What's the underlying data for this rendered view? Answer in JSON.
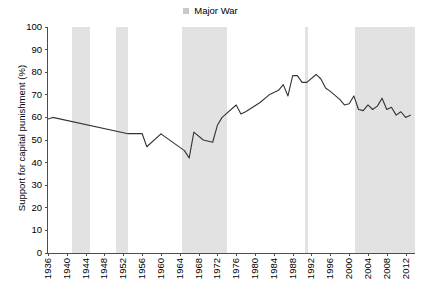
{
  "legend": {
    "position": "top-center",
    "entries": [
      {
        "label": "Major War",
        "swatch_color": "#c9c9c9",
        "icon": "square-swatch-icon"
      }
    ]
  },
  "chart_data": {
    "type": "line",
    "title": "",
    "subtitle": "",
    "xlabel": "",
    "ylabel": "Support for capital punishment (%)",
    "xlim": [
      1936,
      2014
    ],
    "ylim": [
      0,
      100
    ],
    "grid": false,
    "line_color": "#333333",
    "band_color": "#e2e2e2",
    "y_ticks": [
      0,
      10,
      20,
      30,
      40,
      50,
      60,
      70,
      80,
      90,
      100
    ],
    "x_ticks": [
      1936,
      1940,
      1944,
      1948,
      1952,
      1956,
      1960,
      1964,
      1968,
      1972,
      1976,
      1980,
      1984,
      1988,
      1992,
      1996,
      2000,
      2004,
      2008,
      2012
    ],
    "series": [
      {
        "name": "Support for capital punishment (%)",
        "x": [
          1936,
          1937,
          1953,
          1956,
          1957,
          1960,
          1965,
          1966,
          1967,
          1969,
          1971,
          1972,
          1973,
          1976,
          1977,
          1978,
          1981,
          1983,
          1985,
          1986,
          1987,
          1988,
          1989,
          1990,
          1991,
          1993,
          1994,
          1995,
          1996,
          1998,
          1999,
          2000,
          2001,
          2002,
          2003,
          2004,
          2005,
          2006,
          2007,
          2008,
          2009,
          2010,
          2011,
          2012,
          2013
        ],
        "values": [
          59.3,
          60.0,
          52.8,
          52.9,
          47.0,
          52.7,
          45.3,
          42.0,
          53.5,
          50.0,
          49.0,
          56.5,
          60.0,
          65.5,
          61.5,
          62.5,
          66.5,
          70.0,
          72.0,
          74.5,
          69.5,
          78.5,
          78.5,
          75.5,
          75.5,
          79.0,
          77.0,
          73.0,
          71.5,
          68.0,
          65.5,
          66.0,
          69.5,
          63.5,
          63.0,
          65.5,
          63.5,
          65.0,
          68.5,
          63.5,
          64.5,
          61.0,
          62.5,
          60.0,
          61.0
        ]
      }
    ],
    "war_bands": [
      {
        "name": "World War II",
        "start": 1941,
        "end": 1945
      },
      {
        "name": "Korean War",
        "start": 1950.5,
        "end": 1953
      },
      {
        "name": "Vietnam War",
        "start": 1964.5,
        "end": 1974
      },
      {
        "name": "Gulf War",
        "start": 1990.6,
        "end": 1991.3
      },
      {
        "name": "Afghanistan and Iraq Wars",
        "start": 2001.3,
        "end": 2014
      }
    ]
  }
}
